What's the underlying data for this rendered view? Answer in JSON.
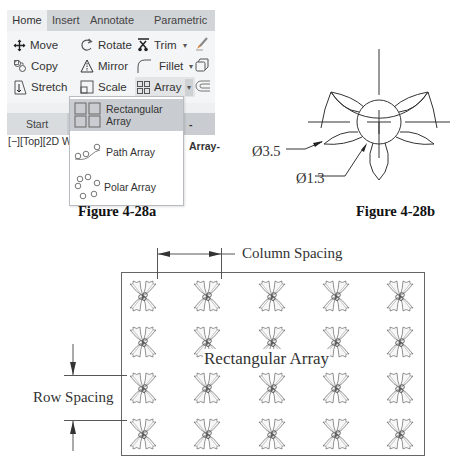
{
  "figure_a": {
    "caption": "Figure 4-28a",
    "ribbon_tabs": [
      {
        "label": "Home",
        "active": true
      },
      {
        "label": "Insert",
        "active": false
      },
      {
        "label": "Annotate",
        "active": false
      },
      {
        "label": "Parametric",
        "active": false
      }
    ],
    "tools": {
      "move": "Move",
      "copy": "Copy",
      "stretch": "Stretch",
      "rotate": "Rotate",
      "mirror": "Mirror",
      "scale": "Scale",
      "trim": "Trim",
      "fillet": "Fillet",
      "array": "Array",
      "dropdown_arrow": "▾"
    },
    "file_tabs": {
      "start": "Start",
      "drawing": "-Array-"
    },
    "viewport_label": "[−][Top][2D W",
    "array_menu": [
      {
        "label": "Rectangular Array",
        "icon": "rectangular-array-icon",
        "selected": true
      },
      {
        "label": "Path Array",
        "icon": "path-array-icon",
        "selected": false
      },
      {
        "label": "Polar Array",
        "icon": "polar-array-icon",
        "selected": false
      }
    ],
    "colors": {
      "tabbar": "#d2d5d8",
      "panel": "#f4f5f6",
      "selected_item": "#c9ccd0"
    }
  },
  "figure_b": {
    "caption": "Figure 4-28b",
    "outer_diameter": "Ø3.5",
    "inner_diameter": "Ø1.3"
  },
  "figure_c": {
    "title": "Rectangular Array",
    "column_spacing_label": "Column Spacing",
    "row_spacing_label": "Row Spacing",
    "rows": 4,
    "columns": 5,
    "motif_icon": "holly-leaf-cluster-icon"
  }
}
